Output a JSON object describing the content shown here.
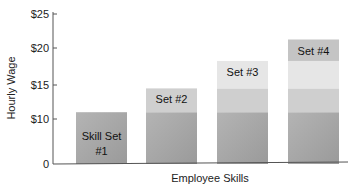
{
  "chart_data": {
    "type": "bar",
    "stacked": true,
    "title": "",
    "xlabel": "Employee Skills",
    "ylabel": "Hourly Wage",
    "ylim": [
      0,
      25
    ],
    "yticks": [
      0,
      10,
      15,
      20,
      25
    ],
    "ytick_labels": [
      "0",
      "$10",
      "$15",
      "$20",
      "$25"
    ],
    "grid": false,
    "categories": [
      "Skill Set #1",
      "Set #2",
      "Set #3",
      "Set #4"
    ],
    "bar_labels": [
      [
        "Skill Set",
        "#1"
      ],
      [
        "Set #2"
      ],
      [
        "Set #3"
      ],
      [
        "Set #4"
      ]
    ],
    "series": [
      {
        "name": "Skill Set #1",
        "values": [
          11,
          11,
          11,
          11
        ],
        "color": "#a8a8a8"
      },
      {
        "name": "Skill Set #2",
        "values": [
          0,
          3.5,
          3.5,
          3.5
        ],
        "color": "#cfcfcf"
      },
      {
        "name": "Skill Set #3",
        "values": [
          0,
          0,
          3.75,
          3.75
        ],
        "color": "#e6e6e6"
      },
      {
        "name": "Skill Set #4",
        "values": [
          0,
          0,
          0,
          3
        ],
        "color": "#c4c4c4"
      }
    ],
    "totals": [
      11,
      14.5,
      18.25,
      21.25
    ]
  }
}
